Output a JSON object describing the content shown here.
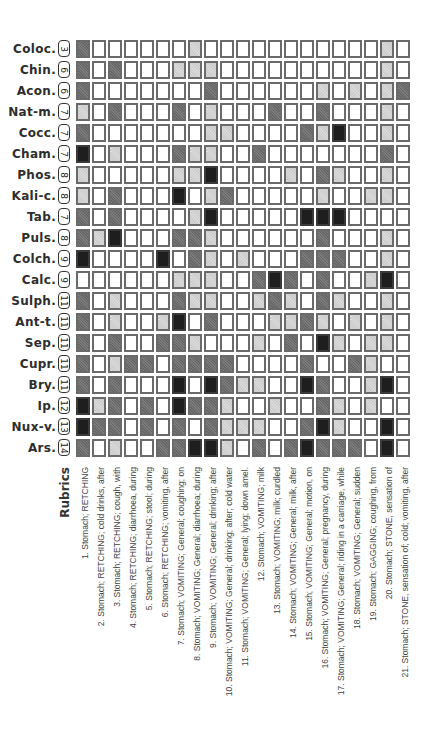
{
  "rubrics_title": "Rubrics",
  "level_colors": {
    "0": "#ffffff",
    "1": "#d9d9d9",
    "2": "#7c7c7c",
    "3": "#1e1e1e"
  },
  "remedies": [
    {
      "name": "Coloc.",
      "count": "3",
      "cells": [
        2,
        0,
        0,
        0,
        0,
        0,
        0,
        1,
        0,
        0,
        0,
        0,
        0,
        0,
        0,
        0,
        0,
        0,
        0,
        1,
        0
      ]
    },
    {
      "name": "Chin.",
      "count": "6",
      "cells": [
        2,
        0,
        2,
        0,
        0,
        0,
        1,
        1,
        1,
        0,
        0,
        0,
        0,
        0,
        0,
        0,
        0,
        0,
        0,
        1,
        0
      ]
    },
    {
      "name": "Acon.",
      "count": "6",
      "cells": [
        2,
        0,
        0,
        0,
        0,
        0,
        0,
        0,
        2,
        0,
        0,
        0,
        0,
        0,
        0,
        1,
        0,
        1,
        0,
        1,
        2
      ]
    },
    {
      "name": "Nat-m.",
      "count": "7",
      "cells": [
        1,
        0,
        2,
        0,
        0,
        0,
        2,
        0,
        1,
        0,
        0,
        0,
        2,
        0,
        0,
        2,
        0,
        0,
        0,
        1,
        0
      ]
    },
    {
      "name": "Cocc.",
      "count": "7",
      "cells": [
        2,
        0,
        0,
        0,
        0,
        0,
        0,
        0,
        1,
        1,
        0,
        0,
        0,
        0,
        2,
        1,
        3,
        0,
        0,
        1,
        0
      ]
    },
    {
      "name": "Cham.",
      "count": "7",
      "cells": [
        3,
        0,
        1,
        0,
        0,
        0,
        2,
        1,
        1,
        0,
        0,
        2,
        0,
        0,
        0,
        0,
        0,
        0,
        0,
        2,
        0
      ]
    },
    {
      "name": "Phos.",
      "count": "8",
      "cells": [
        1,
        0,
        0,
        0,
        0,
        0,
        1,
        1,
        3,
        0,
        0,
        0,
        0,
        1,
        0,
        2,
        1,
        0,
        0,
        1,
        0
      ]
    },
    {
      "name": "Kali-c.",
      "count": "8",
      "cells": [
        1,
        0,
        2,
        0,
        0,
        0,
        3,
        0,
        1,
        2,
        0,
        0,
        0,
        0,
        0,
        1,
        0,
        0,
        1,
        1,
        0
      ]
    },
    {
      "name": "Tab.",
      "count": "7",
      "cells": [
        2,
        0,
        2,
        0,
        0,
        0,
        0,
        1,
        3,
        0,
        0,
        0,
        0,
        0,
        3,
        3,
        3,
        0,
        0,
        0,
        0
      ]
    },
    {
      "name": "Puls.",
      "count": "8",
      "cells": [
        2,
        1,
        3,
        0,
        0,
        0,
        2,
        2,
        1,
        0,
        0,
        0,
        0,
        0,
        0,
        2,
        0,
        0,
        0,
        1,
        0
      ]
    },
    {
      "name": "Colch.",
      "count": "9",
      "cells": [
        3,
        0,
        0,
        0,
        0,
        3,
        0,
        2,
        1,
        0,
        1,
        0,
        0,
        0,
        2,
        2,
        2,
        0,
        0,
        1,
        0
      ]
    },
    {
      "name": "Calc.",
      "count": "9",
      "cells": [
        0,
        0,
        0,
        0,
        0,
        0,
        1,
        1,
        1,
        0,
        0,
        2,
        3,
        2,
        0,
        2,
        0,
        0,
        1,
        3,
        0
      ]
    },
    {
      "name": "Sulph.",
      "count": "11",
      "cells": [
        2,
        0,
        1,
        0,
        0,
        0,
        2,
        1,
        1,
        0,
        0,
        1,
        2,
        1,
        0,
        2,
        1,
        0,
        0,
        1,
        0
      ]
    },
    {
      "name": "Ant-t.",
      "count": "11",
      "cells": [
        2,
        0,
        1,
        0,
        0,
        1,
        3,
        0,
        2,
        0,
        0,
        0,
        1,
        1,
        2,
        1,
        0,
        1,
        0,
        1,
        0
      ]
    },
    {
      "name": "Sep.",
      "count": "11",
      "cells": [
        2,
        0,
        2,
        0,
        0,
        2,
        2,
        1,
        0,
        0,
        0,
        1,
        0,
        2,
        0,
        3,
        1,
        0,
        1,
        1,
        0
      ]
    },
    {
      "name": "Cupr.",
      "count": "11",
      "cells": [
        2,
        0,
        1,
        2,
        2,
        0,
        2,
        2,
        2,
        2,
        0,
        0,
        0,
        0,
        2,
        0,
        0,
        2,
        1,
        0,
        0
      ]
    },
    {
      "name": "Bry.",
      "count": "11",
      "cells": [
        2,
        0,
        2,
        0,
        0,
        0,
        3,
        0,
        3,
        2,
        1,
        1,
        0,
        0,
        3,
        2,
        0,
        0,
        1,
        3,
        0
      ]
    },
    {
      "name": "Ip.",
      "count": "12",
      "cells": [
        3,
        1,
        2,
        0,
        2,
        0,
        3,
        2,
        2,
        1,
        0,
        0,
        1,
        0,
        0,
        2,
        1,
        0,
        1,
        0,
        0
      ]
    },
    {
      "name": "Nux-v.",
      "count": "13",
      "cells": [
        3,
        2,
        2,
        0,
        2,
        0,
        2,
        0,
        2,
        1,
        1,
        1,
        0,
        0,
        2,
        3,
        1,
        0,
        0,
        3,
        0
      ]
    },
    {
      "name": "Ars.",
      "count": "14",
      "cells": [
        2,
        0,
        1,
        0,
        0,
        2,
        2,
        3,
        3,
        1,
        0,
        2,
        0,
        2,
        3,
        2,
        2,
        2,
        0,
        3,
        0
      ]
    }
  ],
  "rubrics": [
    "1. Stomach; RETCHING",
    "2. Stomach; RETCHING; cold drinks, after",
    "3. Stomach; RETCHING; cough, with",
    "4. Stomach; RETCHING; diarrhoea, during",
    "5. Stomach; RETCHING; stool; during",
    "6. Stomach; RETCHING; vomiting, after",
    "7. Stomach; VOMITING; General; coughing; on",
    "8. Stomach; VOMITING; General; diarrhoea; during",
    "9. Stomach; VOMITING; General; drinking; after",
    "10. Stomach; VOMITING; General; drinking; after; cold water",
    "11. Stomach; VOMITING; General; lying; down amel.",
    "12. Stomach; VOMITING; milk",
    "13. Stomach; VOMITING; milk; curdled",
    "14. Stomach; VOMITING; General; milk, after",
    "15. Stomach; VOMITING; General; motion, on",
    "16. Stomach; VOMITING; General; pregnancy, during",
    "17. Stomach; VOMITING; General; riding in a carriage, while",
    "18. Stomach; VOMITING; General; sudden",
    "19. Stomach; GAGGING; coughing, from",
    "20. Stomach; STONE, sensation of",
    "21. Stomach; STONE, sensation of; cold; vomiting, after"
  ]
}
